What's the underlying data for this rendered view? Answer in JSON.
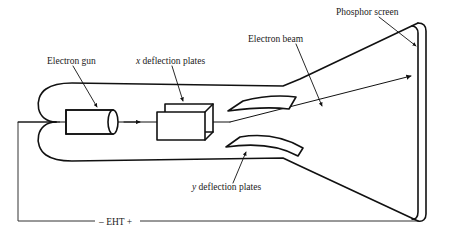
{
  "figure": {
    "type": "diagram",
    "background_color": "#ffffff",
    "line_color": "#111111",
    "text_color": "#1a1a1a"
  },
  "labels": {
    "electron_gun": "Electron gun",
    "x_deflection_symbol": "x",
    "x_deflection_text": " deflection plates",
    "y_deflection_symbol": "y",
    "y_deflection_text": " deflection plates",
    "electron_beam": "Electron beam",
    "phosphor_screen": "Phosphor screen",
    "eht_minus": "– EHT +"
  },
  "components": [
    {
      "id": "electron-gun",
      "label": "Electron gun",
      "shape": "cylinder"
    },
    {
      "id": "x-deflection-plates",
      "label": "x deflection plates",
      "shape": "box-3d"
    },
    {
      "id": "y-deflection-plates",
      "label": "y deflection plates",
      "shape": "curved-plate-pair"
    },
    {
      "id": "electron-beam",
      "label": "Electron beam",
      "shape": "arrowed-line"
    },
    {
      "id": "phosphor-screen",
      "label": "Phosphor screen",
      "shape": "vertical-double-line"
    },
    {
      "id": "eht-supply",
      "label": "– EHT +",
      "shape": "circuit-wire"
    }
  ]
}
